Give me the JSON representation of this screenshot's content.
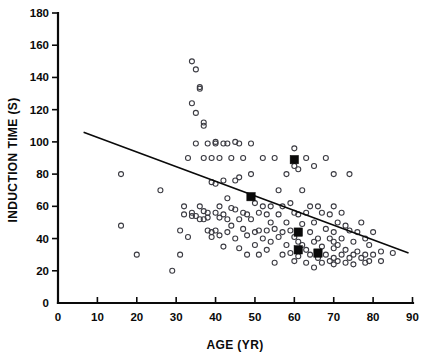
{
  "chart_data": {
    "type": "scatter",
    "title": "",
    "xlabel": "AGE (YR)",
    "ylabel": "INDUCTION TIME (S)",
    "xlim": [
      0,
      90
    ],
    "ylim": [
      0,
      180
    ],
    "xticks": [
      0,
      10,
      20,
      30,
      40,
      50,
      60,
      70,
      80,
      90
    ],
    "yticks": [
      0,
      20,
      40,
      60,
      80,
      100,
      120,
      140,
      160,
      180
    ],
    "xtick_labels": [
      "0",
      "10",
      "20",
      "30",
      "40",
      "50",
      "60",
      "70",
      "80",
      "90"
    ],
    "ytick_labels": [
      "0",
      "20",
      "40",
      "60",
      "80",
      "100",
      "120",
      "140",
      "160",
      "180"
    ],
    "grid": false,
    "legend": "none",
    "series": [
      {
        "name": "Individual patients",
        "marker": "open-circle",
        "color": "#3b3b42",
        "points": [
          [
            16,
            80
          ],
          [
            16,
            48
          ],
          [
            20,
            30
          ],
          [
            26,
            70
          ],
          [
            29,
            20
          ],
          [
            31,
            45
          ],
          [
            31,
            30
          ],
          [
            32,
            55
          ],
          [
            32,
            60
          ],
          [
            33,
            41
          ],
          [
            33,
            90
          ],
          [
            34,
            54
          ],
          [
            34,
            124
          ],
          [
            34,
            150
          ],
          [
            34,
            56
          ],
          [
            35,
            118
          ],
          [
            35,
            99
          ],
          [
            35,
            145
          ],
          [
            35,
            54
          ],
          [
            36,
            133
          ],
          [
            36,
            134
          ],
          [
            36,
            60
          ],
          [
            36,
            52
          ],
          [
            37,
            90
          ],
          [
            37,
            57
          ],
          [
            37,
            52
          ],
          [
            37,
            112
          ],
          [
            37,
            110
          ],
          [
            38,
            99
          ],
          [
            38,
            53
          ],
          [
            38,
            45
          ],
          [
            38,
            56
          ],
          [
            39,
            90
          ],
          [
            39,
            44
          ],
          [
            39,
            75
          ],
          [
            39,
            41
          ],
          [
            40,
            100
          ],
          [
            40,
            99
          ],
          [
            40,
            56
          ],
          [
            40,
            45
          ],
          [
            40,
            74
          ],
          [
            41,
            90
          ],
          [
            41,
            53
          ],
          [
            41,
            42
          ],
          [
            41,
            60
          ],
          [
            42,
            99
          ],
          [
            42,
            55
          ],
          [
            42,
            35
          ],
          [
            42,
            76
          ],
          [
            43,
            99
          ],
          [
            43,
            52
          ],
          [
            43,
            44
          ],
          [
            43,
            65
          ],
          [
            44,
            90
          ],
          [
            44,
            48
          ],
          [
            44,
            59
          ],
          [
            45,
            100
          ],
          [
            45,
            58
          ],
          [
            45,
            40
          ],
          [
            45,
            76
          ],
          [
            46,
            99
          ],
          [
            46,
            78
          ],
          [
            46,
            52
          ],
          [
            46,
            34
          ],
          [
            47,
            90
          ],
          [
            47,
            56
          ],
          [
            47,
            46
          ],
          [
            48,
            55
          ],
          [
            48,
            42
          ],
          [
            48,
            30
          ],
          [
            49,
            99
          ],
          [
            49,
            80
          ],
          [
            49,
            52
          ],
          [
            50,
            62
          ],
          [
            50,
            44
          ],
          [
            50,
            36
          ],
          [
            51,
            56
          ],
          [
            51,
            45
          ],
          [
            51,
            30
          ],
          [
            52,
            90
          ],
          [
            52,
            60
          ],
          [
            52,
            40
          ],
          [
            53,
            55
          ],
          [
            53,
            45
          ],
          [
            53,
            33
          ],
          [
            54,
            60
          ],
          [
            54,
            50
          ],
          [
            54,
            38
          ],
          [
            55,
            90
          ],
          [
            55,
            46
          ],
          [
            55,
            25
          ],
          [
            56,
            70
          ],
          [
            56,
            55
          ],
          [
            56,
            41
          ],
          [
            57,
            60
          ],
          [
            57,
            44
          ],
          [
            57,
            30
          ],
          [
            58,
            80
          ],
          [
            58,
            50
          ],
          [
            58,
            36
          ],
          [
            59,
            62
          ],
          [
            59,
            45
          ],
          [
            59,
            31
          ],
          [
            60,
            96
          ],
          [
            60,
            85
          ],
          [
            60,
            56
          ],
          [
            60,
            41
          ],
          [
            60,
            26
          ],
          [
            61,
            83
          ],
          [
            61,
            55
          ],
          [
            61,
            38
          ],
          [
            61,
            29
          ],
          [
            62,
            70
          ],
          [
            62,
            49
          ],
          [
            62,
            36
          ],
          [
            63,
            90
          ],
          [
            63,
            56
          ],
          [
            63,
            33
          ],
          [
            63,
            25
          ],
          [
            64,
            60
          ],
          [
            64,
            44
          ],
          [
            64,
            30
          ],
          [
            65,
            85
          ],
          [
            65,
            50
          ],
          [
            65,
            38
          ],
          [
            65,
            22
          ],
          [
            66,
            60
          ],
          [
            66,
            40
          ],
          [
            66,
            28
          ],
          [
            67,
            56
          ],
          [
            67,
            35
          ],
          [
            67,
            25
          ],
          [
            68,
            90
          ],
          [
            68,
            46
          ],
          [
            68,
            30
          ],
          [
            69,
            55
          ],
          [
            69,
            40
          ],
          [
            69,
            26
          ],
          [
            70,
            80
          ],
          [
            70,
            60
          ],
          [
            70,
            44
          ],
          [
            70,
            38
          ],
          [
            70,
            34
          ],
          [
            70,
            28
          ],
          [
            70,
            24
          ],
          [
            71,
            50
          ],
          [
            71,
            36
          ],
          [
            71,
            26
          ],
          [
            72,
            56
          ],
          [
            72,
            40
          ],
          [
            72,
            30
          ],
          [
            73,
            48
          ],
          [
            73,
            33
          ],
          [
            73,
            25
          ],
          [
            74,
            80
          ],
          [
            74,
            45
          ],
          [
            74,
            28
          ],
          [
            75,
            38
          ],
          [
            75,
            30
          ],
          [
            75,
            24
          ],
          [
            76,
            44
          ],
          [
            76,
            32
          ],
          [
            77,
            50
          ],
          [
            77,
            28
          ],
          [
            78,
            40
          ],
          [
            78,
            30
          ],
          [
            78,
            25
          ],
          [
            79,
            36
          ],
          [
            79,
            26
          ],
          [
            80,
            44
          ],
          [
            80,
            30
          ],
          [
            82,
            32
          ],
          [
            82,
            26
          ],
          [
            85,
            31
          ]
        ]
      },
      {
        "name": "Group means",
        "marker": "filled-square",
        "color": "#0a0a0a",
        "points": [
          [
            49,
            66
          ],
          [
            60,
            89
          ],
          [
            61,
            44
          ],
          [
            61,
            33
          ],
          [
            66,
            31
          ]
        ]
      }
    ],
    "regression_line": {
      "label": "least-squares fit",
      "x_start": 6.5,
      "y_start": 106,
      "x_end": 89,
      "y_end": 31
    }
  }
}
